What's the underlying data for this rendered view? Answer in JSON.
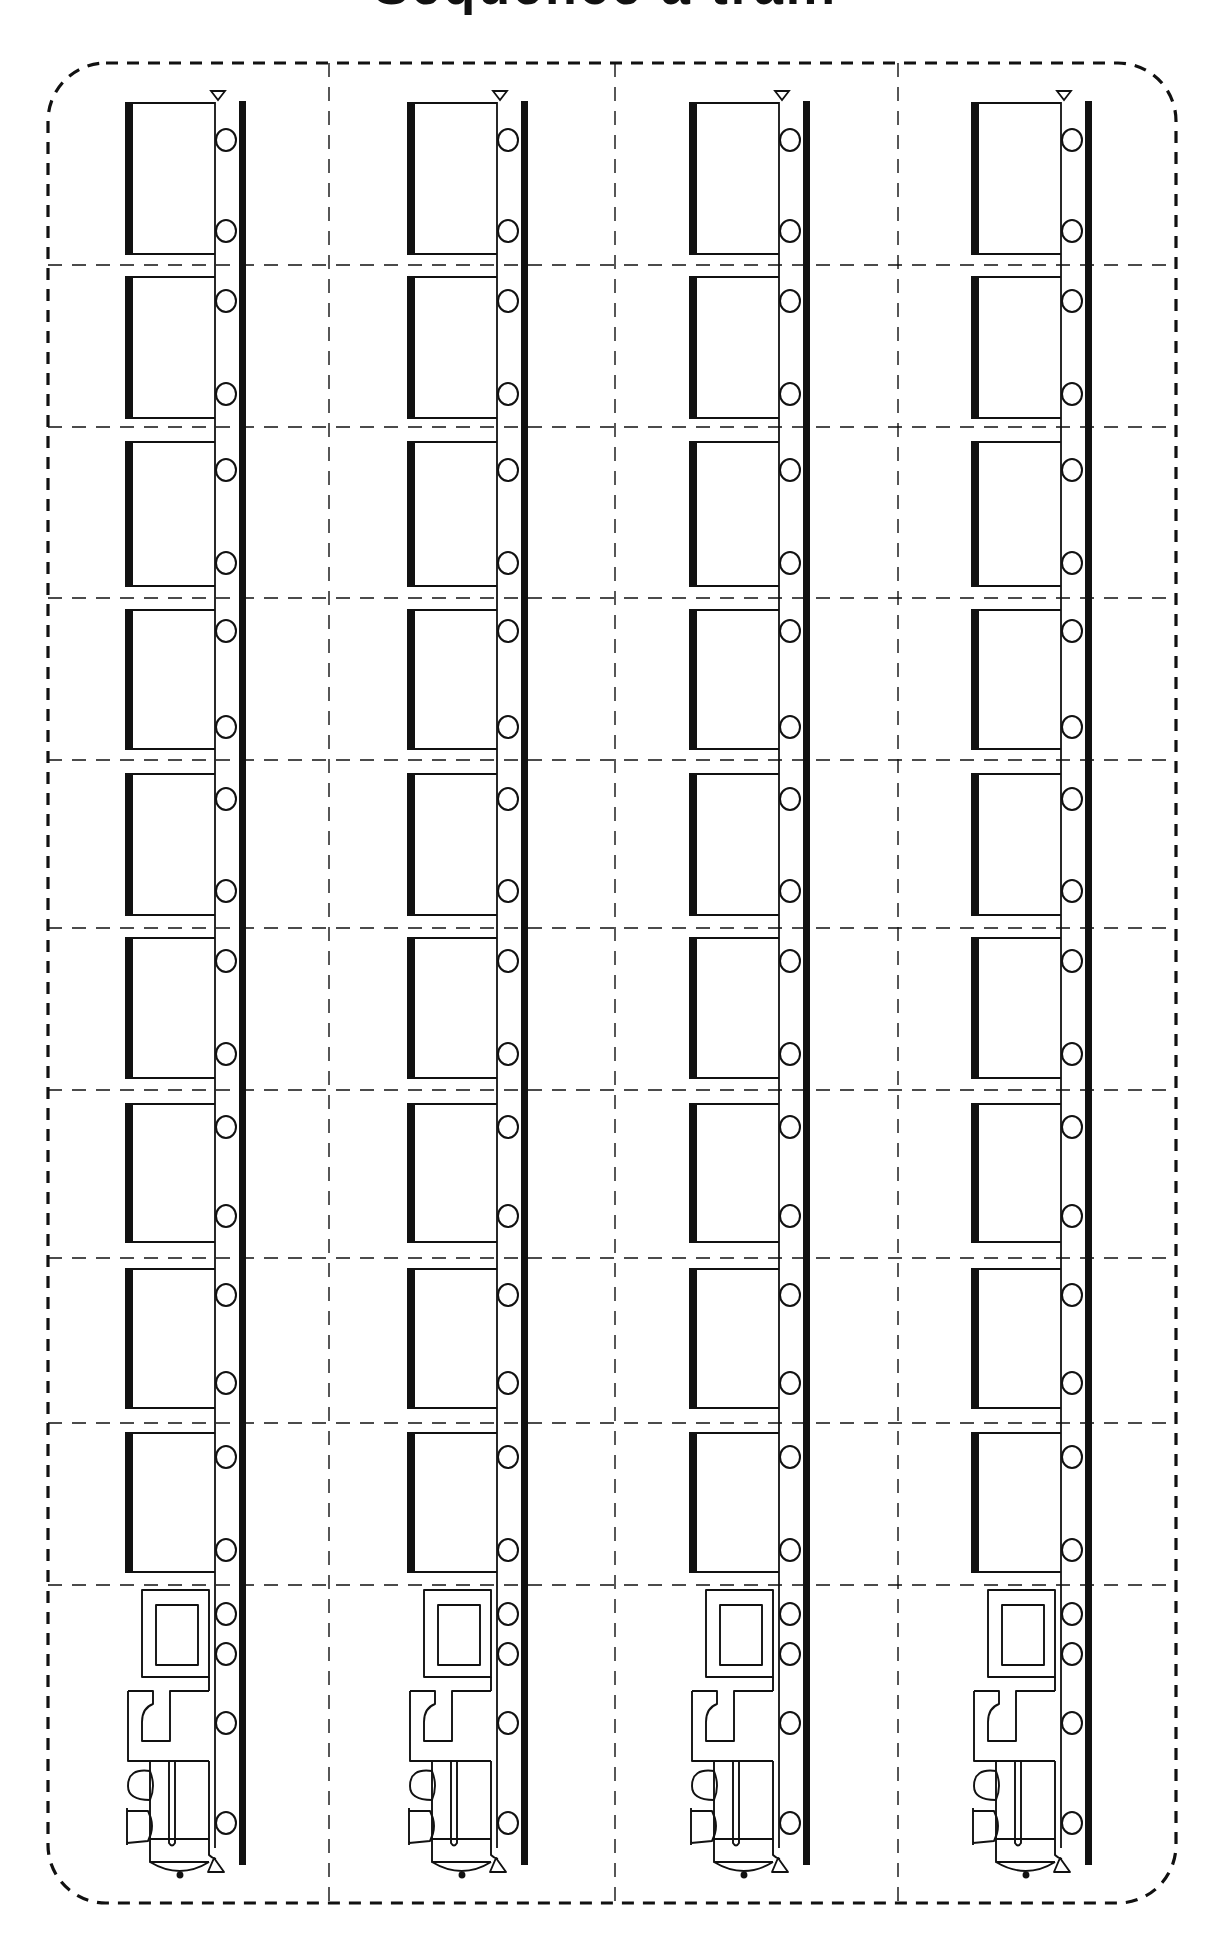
{
  "worksheet": {
    "title": "Sequence a train",
    "title_visible_portion": "bottom edge only (cropped)",
    "colors": {
      "ink": "#111111",
      "paper": "#ffffff"
    },
    "cut_border": {
      "style": "dashed",
      "left": 48,
      "top": 63,
      "right": 1176,
      "bottom": 1903,
      "corner_radius": 58
    },
    "grid": {
      "columns": 4,
      "rows": 10,
      "column_dividers_x": [
        329,
        615,
        898
      ],
      "row_dividers_y": [
        265,
        427,
        598,
        760,
        928,
        1090,
        1258,
        1423,
        1585
      ]
    },
    "trains": [
      {
        "label": "Train 1",
        "x": 125
      },
      {
        "label": "Train 2",
        "x": 407
      },
      {
        "label": "Train 3",
        "x": 689
      },
      {
        "label": "Train 4",
        "x": 971
      }
    ],
    "cars": [
      {
        "label": "Car 1",
        "top": 102,
        "bottom": 255,
        "wheels": [
          140,
          231
        ]
      },
      {
        "label": "Car 2",
        "top": 276,
        "bottom": 419,
        "wheels": [
          301,
          394
        ]
      },
      {
        "label": "Car 3",
        "top": 441,
        "bottom": 587,
        "wheels": [
          470,
          563
        ]
      },
      {
        "label": "Car 4",
        "top": 609,
        "bottom": 750,
        "wheels": [
          631,
          727
        ]
      },
      {
        "label": "Car 5",
        "top": 773,
        "bottom": 916,
        "wheels": [
          799,
          891
        ]
      },
      {
        "label": "Car 6",
        "top": 937,
        "bottom": 1079,
        "wheels": [
          961,
          1054
        ]
      },
      {
        "label": "Car 7",
        "top": 1103,
        "bottom": 1243,
        "wheels": [
          1127,
          1216
        ]
      },
      {
        "label": "Car 8",
        "top": 1268,
        "bottom": 1409,
        "wheels": [
          1295,
          1383
        ]
      },
      {
        "label": "Car 9",
        "top": 1432,
        "bottom": 1573,
        "wheels": [
          1457,
          1550
        ]
      }
    ],
    "locomotive": {
      "label": "Engine",
      "top": 1590,
      "bottom": 1872,
      "wheels": [
        1614,
        1654,
        1723,
        1823
      ]
    },
    "rail": {
      "top": 101,
      "bottom": 1865
    }
  }
}
